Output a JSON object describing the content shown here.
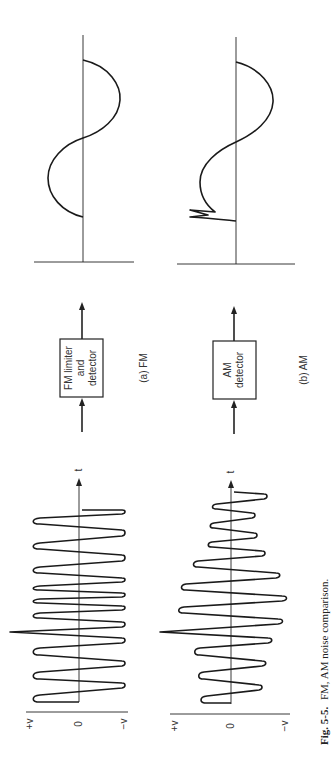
{
  "figure": {
    "caption_label": "Fig. 5-5.",
    "caption_text": "FM, AM noise comparison.",
    "orientation": "rotated 90° counter-clockwise"
  },
  "panels": [
    {
      "id": "a",
      "label": "(a) FM",
      "input_axis": {
        "top_label": "+v",
        "zero_label": "0",
        "bottom_label": "−v",
        "time_label": "t"
      },
      "block": {
        "lines": [
          "FM limiter",
          "and",
          "detector"
        ]
      },
      "input_signal": "constant-amplitude FM carrier with a single noise spike",
      "output_signal": "clean sine wave (noise removed)"
    },
    {
      "id": "b",
      "label": "(b) AM",
      "input_axis": {
        "top_label": "+v",
        "zero_label": "0",
        "bottom_label": "−v",
        "time_label": "t"
      },
      "block": {
        "lines": [
          "AM",
          "detector"
        ]
      },
      "input_signal": "amplitude-modulated carrier with a single noise spike",
      "output_signal": "sine-wave envelope retaining the noise spike"
    }
  ],
  "colors": {
    "ink": "#1a1a1a",
    "background": "#ffffff"
  }
}
